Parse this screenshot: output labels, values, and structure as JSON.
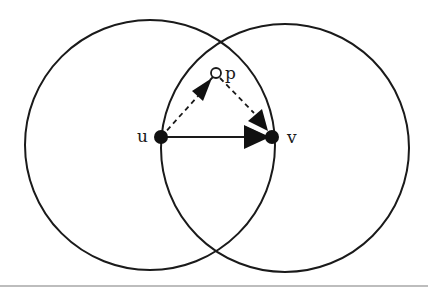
{
  "figure": {
    "type": "geometric-diagram",
    "colors": {
      "stroke": "#1a1a1a",
      "node_fill": "#111111",
      "hollow_fill": "#ffffff",
      "background": "#ffffff",
      "rule": "#bdbdbd"
    },
    "circles": [
      {
        "id": "circle-u",
        "cx": 150,
        "cy": 145,
        "r": 125
      },
      {
        "id": "circle-v",
        "cx": 285,
        "cy": 148,
        "r": 124
      }
    ],
    "nodes": [
      {
        "id": "u",
        "label": "u",
        "x": 161,
        "y": 137,
        "r": 7,
        "filled": true,
        "label_x": 137,
        "label_y": 142
      },
      {
        "id": "v",
        "label": "v",
        "x": 272,
        "y": 137,
        "r": 7,
        "filled": true,
        "label_x": 287,
        "label_y": 143
      },
      {
        "id": "p",
        "label": "p",
        "x": 216,
        "y": 73,
        "r": 5,
        "filled": false,
        "label_x": 225,
        "label_y": 79
      }
    ],
    "edges": [
      {
        "from": "u",
        "to": "p",
        "style": "dashed"
      },
      {
        "from": "p",
        "to": "v",
        "style": "dashed"
      },
      {
        "from": "u",
        "to": "v",
        "style": "solid"
      }
    ]
  }
}
